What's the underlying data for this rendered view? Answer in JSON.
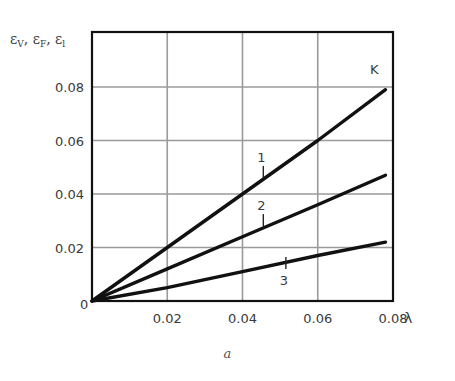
{
  "chart_data": {
    "type": "line",
    "title": "",
    "caption": "a",
    "xlabel": "λ",
    "ylabel": "εV, εF, εl",
    "ylabel_parts": [
      {
        "base": "ε",
        "sub": "V",
        "sep": ", "
      },
      {
        "base": "ε",
        "sub": "F",
        "sep": ", "
      },
      {
        "base": "ε",
        "sub": "l",
        "sep": ""
      }
    ],
    "xlim": [
      0,
      0.08
    ],
    "ylim": [
      0,
      0.09
    ],
    "grid": true,
    "legend": "inline curve labels",
    "x_ticks": [
      {
        "value": 0,
        "label": "0"
      },
      {
        "value": 0.02,
        "label": "0.02"
      },
      {
        "value": 0.04,
        "label": "0.04"
      },
      {
        "value": 0.06,
        "label": "0.06"
      },
      {
        "value": 0.08,
        "label": "0.08"
      }
    ],
    "y_ticks": [
      {
        "value": 0.02,
        "label": "0.02"
      },
      {
        "value": 0.04,
        "label": "0.04"
      },
      {
        "value": 0.06,
        "label": "0.06"
      },
      {
        "value": 0.08,
        "label": "0.08"
      }
    ],
    "end_annotation": {
      "text": "K",
      "x": 0.075,
      "y": 0.085
    },
    "series": [
      {
        "name": "1",
        "x": [
          0,
          0.02,
          0.04,
          0.06,
          0.078
        ],
        "y": [
          0,
          0.02,
          0.04,
          0.06,
          0.079
        ],
        "label_at": {
          "x": 0.045,
          "y": 0.052
        }
      },
      {
        "name": "2",
        "x": [
          0,
          0.02,
          0.04,
          0.06,
          0.078
        ],
        "y": [
          0,
          0.012,
          0.024,
          0.036,
          0.047
        ],
        "label_at": {
          "x": 0.045,
          "y": 0.034
        }
      },
      {
        "name": "3",
        "x": [
          0,
          0.02,
          0.04,
          0.06,
          0.078
        ],
        "y": [
          0,
          0.005,
          0.011,
          0.017,
          0.022
        ],
        "label_at": {
          "x": 0.051,
          "y": 0.006
        }
      }
    ]
  }
}
